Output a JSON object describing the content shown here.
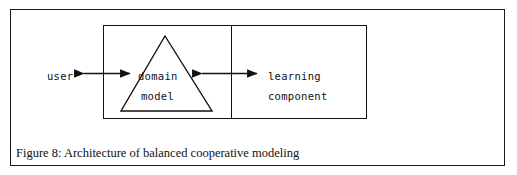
{
  "figure": {
    "caption": "Figure 8: Architecture of balanced cooperative modeling",
    "background_color": "#ffffff",
    "line_color": "#111111"
  },
  "diagram": {
    "type": "block-diagram",
    "external_actor": {
      "label": "user"
    },
    "system_box": {
      "left_compartment": {
        "shape": "triangle",
        "label_line1": "domain",
        "label_line2": "model"
      },
      "right_compartment": {
        "shape": "rectangle",
        "label_line1": "learning",
        "label_line2": "component"
      }
    },
    "connectors": [
      {
        "name": "user-to-domain-model",
        "style": "double-headed-arrow",
        "from": "user",
        "to": "domain model"
      },
      {
        "name": "domain-model-to-learning-component",
        "style": "double-headed-arrow",
        "from": "domain model",
        "to": "learning component"
      }
    ]
  }
}
